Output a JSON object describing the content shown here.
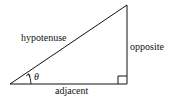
{
  "diagram": {
    "labels": {
      "hypotenuse": "hypotenuse",
      "opposite": "opposite",
      "adjacent": "adjacent",
      "angle": "θ"
    },
    "vertices": {
      "angle_vertex": [
        10,
        84
      ],
      "apex": [
        127,
        5
      ],
      "right_angle_vertex": [
        127,
        84
      ]
    },
    "right_angle_marker": true,
    "stroke_color": "#111111",
    "background_color": "#ffffff"
  }
}
